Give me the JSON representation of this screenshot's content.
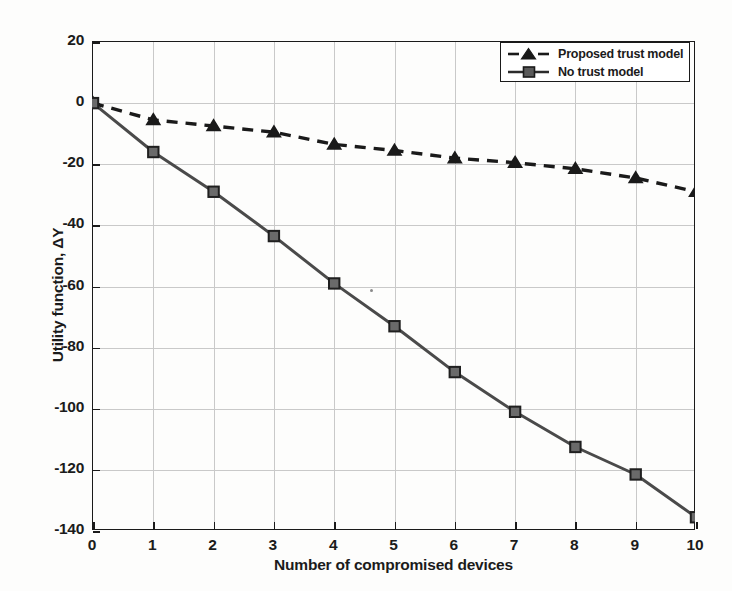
{
  "chart_data": {
    "type": "line",
    "title": "",
    "xlabel": "Number of compromised devices",
    "ylabel": "Utility function, ΔY",
    "x": [
      0,
      1,
      2,
      3,
      4,
      5,
      6,
      7,
      8,
      9,
      10
    ],
    "xtick_labels": [
      "0",
      "1",
      "2",
      "3",
      "4",
      "5",
      "6",
      "7",
      "8",
      "9",
      "10"
    ],
    "ytick_labels": [
      "20",
      "0",
      "-20",
      "-40",
      "-60",
      "-80",
      "-100",
      "-120",
      "-140"
    ],
    "yticks": [
      20,
      0,
      -20,
      -40,
      -60,
      -80,
      -100,
      -120,
      -140
    ],
    "xlim": [
      0,
      10
    ],
    "ylim": [
      -140,
      20
    ],
    "grid": true,
    "legend_position": "top-right",
    "series": [
      {
        "name": "Proposed trust model",
        "marker": "triangle",
        "linestyle": "dashed",
        "color": "#1a1a1a",
        "values": [
          0,
          -5.5,
          -7.5,
          -9.5,
          -13.5,
          -15.5,
          -18,
          -19.5,
          -21.5,
          -24.5,
          -29
        ]
      },
      {
        "name": "No trust model",
        "marker": "square",
        "linestyle": "solid",
        "color": "#4a4a4a",
        "values": [
          0,
          -16,
          -29,
          -43.5,
          -59,
          -73,
          -88,
          -101,
          -112.5,
          -121.5,
          -135.5
        ]
      }
    ]
  },
  "legend": {
    "items": [
      {
        "label": "Proposed trust model",
        "marker": "triangle",
        "linestyle": "dashed"
      },
      {
        "label": "No trust model",
        "marker": "square",
        "linestyle": "solid"
      }
    ]
  },
  "colors": {
    "axis": "#1a1a1a",
    "grid": "#c9c9c9",
    "series_proposed": "#1a1a1a",
    "series_notrust": "#4a4a4a",
    "background": "#fdfdfd"
  }
}
